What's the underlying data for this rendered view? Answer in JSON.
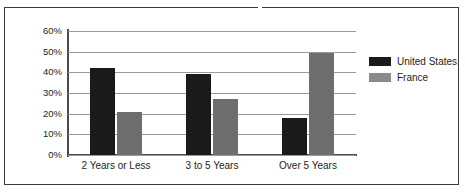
{
  "chart_data": {
    "type": "bar",
    "title": "",
    "subtitle": "",
    "xlabel": "",
    "ylabel": "",
    "categories": [
      "2 Years or Less",
      "3 to 5 Years",
      "Over 5 Years"
    ],
    "series": [
      {
        "name": "United States",
        "color": "#1a1a1a",
        "values": [
          42,
          39,
          18
        ]
      },
      {
        "name": "France",
        "color": "#6e6e6e",
        "values": [
          21,
          27,
          49.5
        ]
      }
    ],
    "ylim": [
      0,
      60
    ],
    "ytick_values": [
      0,
      10,
      20,
      30,
      40,
      50,
      60
    ],
    "ytick_labels": [
      "0%",
      "10%",
      "20%",
      "30%",
      "40%",
      "50%",
      "60%"
    ],
    "grid": true,
    "grid_axis": "y",
    "legend_position": "right",
    "value_suffix": "%"
  },
  "legend": {
    "entries": [
      {
        "label": "United States"
      },
      {
        "label": "France"
      }
    ]
  },
  "colors": {
    "series_united_states": "#1a1a1a",
    "series_france": "#6e6e6e",
    "gridline": "#9a9a9a",
    "axis": "#4a4a4a",
    "frame": "#3a3a3a",
    "background": "#ffffff",
    "text": "#1d1d1d"
  }
}
